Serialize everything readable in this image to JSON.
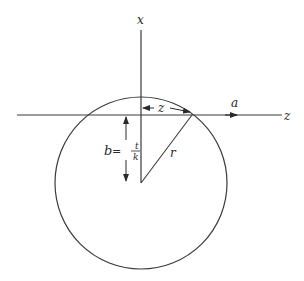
{
  "diagram": {
    "labels": {
      "x_axis": "x",
      "z_axis": "z",
      "a_arrow": "a",
      "z_distance": "z",
      "radius": "r",
      "b_lhs": "b",
      "b_eq": "=",
      "b_num": "t",
      "b_den": "k"
    },
    "geometry": {
      "circle_center": [
        141,
        183
      ],
      "circle_radius": 86,
      "horizontal_axis_y": 115,
      "vertical_axis_x": 141,
      "intersection_point": [
        192,
        115
      ]
    },
    "colors": {
      "stroke": "#3a3a3a",
      "text": "#2a2a2a"
    }
  }
}
